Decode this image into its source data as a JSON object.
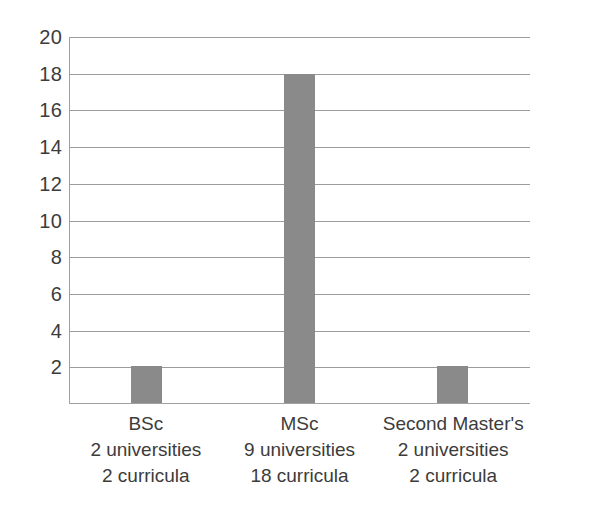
{
  "chart_data": {
    "type": "bar",
    "title": "",
    "subtitle": "",
    "xlabel": "",
    "ylabel": "",
    "categories": [
      "BSc",
      "MSc",
      "Second Master's"
    ],
    "category_sublabels": [
      [
        "2 universities",
        "2 curricula"
      ],
      [
        "9 universities",
        "18 curricula"
      ],
      [
        "2 universities",
        "2 curricula"
      ]
    ],
    "values": [
      2,
      18,
      2
    ],
    "ylim": [
      0,
      20
    ],
    "ytick_labels": [
      "20",
      "18",
      "16",
      "14",
      "12",
      "10",
      "8",
      "6",
      "4",
      "2"
    ],
    "ytick_values": [
      20,
      18,
      16,
      14,
      12,
      10,
      8,
      6,
      4,
      2
    ],
    "ytick_step": 2,
    "grid": true,
    "grid_axis": "y",
    "legend": false,
    "legend_position": "none",
    "bar_color": "#8a8a8a",
    "grid_color": "#9c9c9c",
    "axis_color": "#a0a0a0",
    "text_color": "#3c3c3c",
    "background_color": "#ffffff"
  },
  "axes": {
    "y": {
      "ticks": [
        {
          "label": "20",
          "value": 20
        },
        {
          "label": "18",
          "value": 18
        },
        {
          "label": "16",
          "value": 16
        },
        {
          "label": "14",
          "value": 14
        },
        {
          "label": "12",
          "value": 12
        },
        {
          "label": "10",
          "value": 10
        },
        {
          "label": "8",
          "value": 8
        },
        {
          "label": "6",
          "value": 6
        },
        {
          "label": "4",
          "value": 4
        },
        {
          "label": "2",
          "value": 2
        }
      ]
    }
  },
  "series": [
    {
      "name": "",
      "points": [
        {
          "category": "BSc",
          "value": 2,
          "line1": "BSc",
          "line2": "2 universities",
          "line3": "2 curricula"
        },
        {
          "category": "MSc",
          "value": 18,
          "line1": "MSc",
          "line2": "9 universities",
          "line3": "18 curricula"
        },
        {
          "category": "Second Master's",
          "value": 2,
          "line1": "Second Master's",
          "line2": "2 universities",
          "line3": "2 curricula"
        }
      ]
    }
  ]
}
